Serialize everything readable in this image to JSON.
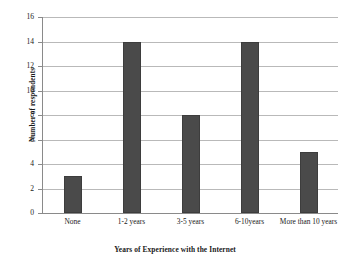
{
  "chart_data": {
    "type": "bar",
    "title": "",
    "xlabel": "Years of Experience with the Internet",
    "ylabel": "Number of respondents",
    "categories": [
      "None",
      "1-2 years",
      "3-5 years",
      "6-10years",
      "More than 10 years"
    ],
    "values": [
      3,
      14,
      8,
      14,
      5
    ],
    "ylim": [
      0,
      16
    ],
    "ytick_step": 2,
    "yticks": [
      "16",
      "14",
      "12",
      "10",
      "8",
      "6",
      "4",
      "2",
      "0"
    ],
    "grid": true,
    "legend": "none",
    "bar_color": "#4a4a4a",
    "gridline_color": "#b9b9b9",
    "axis_color": "#8a8a8a",
    "background_color": "#ffffff"
  }
}
